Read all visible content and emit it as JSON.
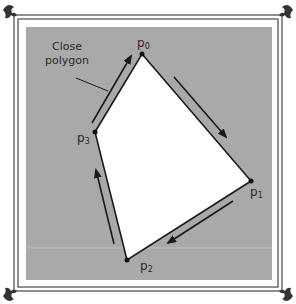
{
  "diagram": {
    "annotation": {
      "line1": "Close",
      "line2": "polygon"
    },
    "points": [
      {
        "name": "p",
        "sub": "0",
        "x": 142,
        "y": 54
      },
      {
        "name": "p",
        "sub": "1",
        "x": 251,
        "y": 181
      },
      {
        "name": "p",
        "sub": "2",
        "x": 127,
        "y": 260
      },
      {
        "name": "p",
        "sub": "3",
        "x": 95,
        "y": 132
      }
    ],
    "colors": {
      "background": "#a9a9a9",
      "polygon_fill": "#ffffff",
      "stroke": "#1a1a1a",
      "frame": "#555555"
    }
  }
}
